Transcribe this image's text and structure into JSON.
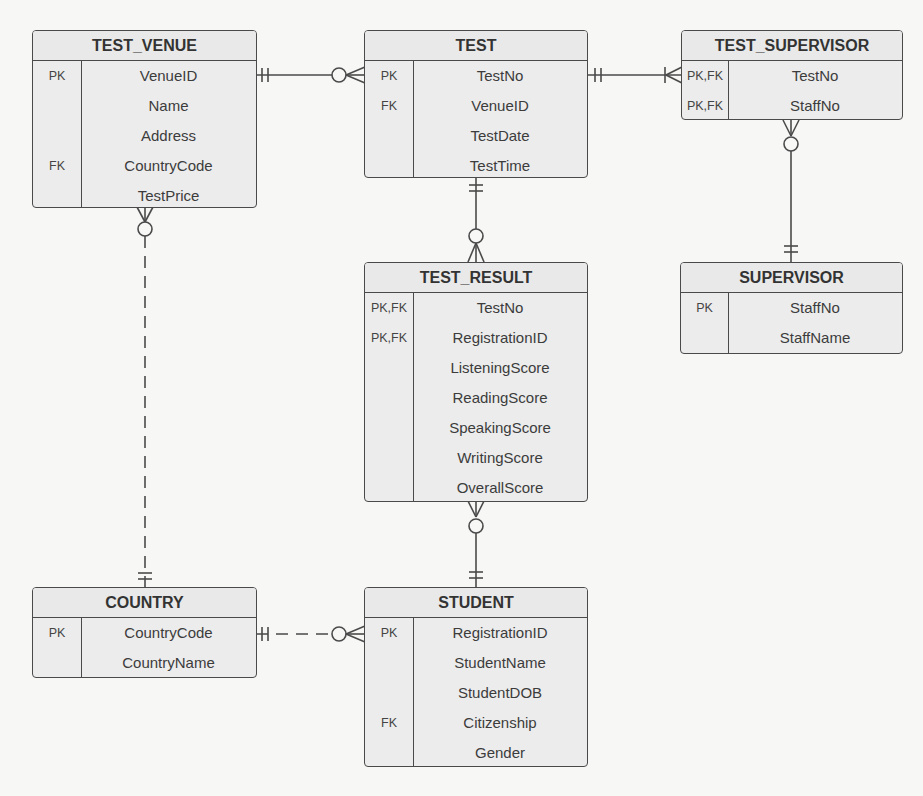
{
  "diagram": {
    "type": "er-diagram-crows-foot",
    "entities": {
      "test_venue": {
        "title": "TEST_VENUE",
        "rows": [
          {
            "key": "PK",
            "attr": "VenueID"
          },
          {
            "key": "",
            "attr": "Name"
          },
          {
            "key": "",
            "attr": "Address"
          },
          {
            "key": "FK",
            "attr": "CountryCode"
          },
          {
            "key": "",
            "attr": "TestPrice"
          }
        ]
      },
      "test": {
        "title": "TEST",
        "rows": [
          {
            "key": "PK",
            "attr": "TestNo"
          },
          {
            "key": "FK",
            "attr": "VenueID"
          },
          {
            "key": "",
            "attr": "TestDate"
          },
          {
            "key": "",
            "attr": "TestTime"
          }
        ]
      },
      "test_supervisor": {
        "title": "TEST_SUPERVISOR",
        "rows": [
          {
            "key": "PK,FK",
            "attr": "TestNo"
          },
          {
            "key": "PK,FK",
            "attr": "StaffNo"
          }
        ]
      },
      "supervisor": {
        "title": "SUPERVISOR",
        "rows": [
          {
            "key": "PK",
            "attr": "StaffNo"
          },
          {
            "key": "",
            "attr": "StaffName"
          }
        ]
      },
      "test_result": {
        "title": "TEST_RESULT",
        "rows": [
          {
            "key": "PK,FK",
            "attr": "TestNo"
          },
          {
            "key": "PK,FK",
            "attr": "RegistrationID"
          },
          {
            "key": "",
            "attr": "ListeningScore"
          },
          {
            "key": "",
            "attr": "ReadingScore"
          },
          {
            "key": "",
            "attr": "SpeakingScore"
          },
          {
            "key": "",
            "attr": "WritingScore"
          },
          {
            "key": "",
            "attr": "OverallScore"
          }
        ]
      },
      "country": {
        "title": "COUNTRY",
        "rows": [
          {
            "key": "PK",
            "attr": "CountryCode"
          },
          {
            "key": "",
            "attr": "CountryName"
          }
        ]
      },
      "student": {
        "title": "STUDENT",
        "rows": [
          {
            "key": "PK",
            "attr": "RegistrationID"
          },
          {
            "key": "",
            "attr": "StudentName"
          },
          {
            "key": "",
            "attr": "StudentDOB"
          },
          {
            "key": "FK",
            "attr": "Citizenship"
          },
          {
            "key": "",
            "attr": "Gender"
          }
        ]
      }
    },
    "relationships": [
      {
        "from": "TEST_VENUE",
        "to": "TEST",
        "from_card": "one-and-only-one",
        "to_card": "zero-or-many",
        "line": "solid"
      },
      {
        "from": "TEST",
        "to": "TEST_SUPERVISOR",
        "from_card": "one-and-only-one",
        "to_card": "one-or-many",
        "line": "solid"
      },
      {
        "from": "SUPERVISOR",
        "to": "TEST_SUPERVISOR",
        "from_card": "one-and-only-one",
        "to_card": "zero-or-many",
        "line": "solid"
      },
      {
        "from": "TEST",
        "to": "TEST_RESULT",
        "from_card": "one-and-only-one",
        "to_card": "zero-or-many",
        "line": "solid"
      },
      {
        "from": "STUDENT",
        "to": "TEST_RESULT",
        "from_card": "one-and-only-one",
        "to_card": "zero-or-many",
        "line": "solid"
      },
      {
        "from": "COUNTRY",
        "to": "TEST_VENUE",
        "from_card": "one-and-only-one",
        "to_card": "zero-or-many",
        "line": "dashed"
      },
      {
        "from": "COUNTRY",
        "to": "STUDENT",
        "from_card": "one-and-only-one",
        "to_card": "zero-or-many",
        "line": "dashed"
      }
    ],
    "colors": {
      "background": "#f7f7f6",
      "entity_fill": "#ececec",
      "stroke": "#4a4a4a",
      "text": "#333333"
    }
  }
}
